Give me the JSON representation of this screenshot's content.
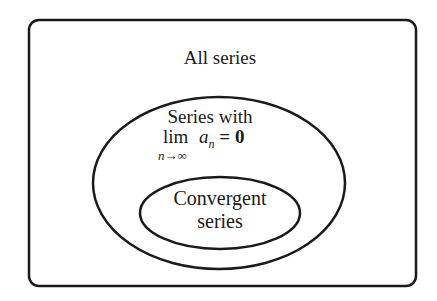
{
  "diagram": {
    "type": "venn-nested",
    "sets": [
      {
        "id": "all",
        "label": "All series",
        "shape": "rounded-rectangle"
      },
      {
        "id": "limzero",
        "label_line1": "Series with",
        "label_lim": "lim",
        "label_term": "a",
        "label_sub": "n",
        "label_eq": "= 0",
        "label_under": "n→∞",
        "shape": "ellipse",
        "parent": "all"
      },
      {
        "id": "convergent",
        "label_line1": "Convergent",
        "label_line2": "series",
        "shape": "ellipse",
        "parent": "limzero"
      }
    ],
    "stroke_color": "#1a1a1a"
  }
}
